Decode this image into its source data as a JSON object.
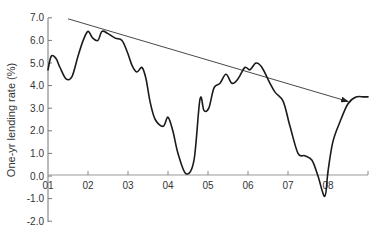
{
  "chart_data": {
    "type": "line",
    "title": "",
    "xlabel": "",
    "ylabel": "One-yr lending rate (%)",
    "ylim": [
      -2.0,
      7.0
    ],
    "xlim": [
      2001,
      2009
    ],
    "yticks": [
      "7.0",
      "6.0",
      "5.0",
      "4.0",
      "3.0",
      "2.0",
      "1.0",
      "0.0",
      "-1.0",
      "-2.0"
    ],
    "xticks": [
      "01",
      "02",
      "03",
      "04",
      "05",
      "06",
      "07",
      "08"
    ],
    "grid": false,
    "legend": null,
    "series": [
      {
        "name": "One-yr lending rate",
        "x": [
          2001.0,
          2001.08,
          2001.2,
          2001.3,
          2001.45,
          2001.6,
          2001.75,
          2001.88,
          2002.0,
          2002.12,
          2002.25,
          2002.35,
          2002.5,
          2002.68,
          2002.85,
          2002.98,
          2003.1,
          2003.22,
          2003.35,
          2003.45,
          2003.55,
          2003.68,
          2003.88,
          2004.0,
          2004.12,
          2004.25,
          2004.45,
          2004.65,
          2004.8,
          2004.9,
          2005.02,
          2005.15,
          2005.3,
          2005.45,
          2005.6,
          2005.75,
          2005.92,
          2006.05,
          2006.2,
          2006.35,
          2006.55,
          2006.68,
          2006.88,
          2007.05,
          2007.25,
          2007.42,
          2007.6,
          2007.75,
          2007.92,
          2008.0,
          2008.12,
          2008.3,
          2008.5,
          2008.7,
          2008.9,
          2009.0
        ],
        "values": [
          4.7,
          5.3,
          5.2,
          4.8,
          4.3,
          4.4,
          5.3,
          6.0,
          6.4,
          6.1,
          6.0,
          6.4,
          6.3,
          6.1,
          6.0,
          5.5,
          4.9,
          4.6,
          4.8,
          4.3,
          3.3,
          2.5,
          2.2,
          2.6,
          2.0,
          1.0,
          0.1,
          0.7,
          3.4,
          2.9,
          3.0,
          3.9,
          4.1,
          4.5,
          4.1,
          4.3,
          4.8,
          4.7,
          5.0,
          4.8,
          4.1,
          3.7,
          3.3,
          2.2,
          1.0,
          0.9,
          0.7,
          0.0,
          -0.9,
          0.2,
          1.5,
          2.4,
          3.2,
          3.5,
          3.5,
          3.5
        ]
      }
    ],
    "annotations": [
      {
        "type": "arrow",
        "description": "Downward trend arrow from early 2001 peak level to late 2008",
        "from": {
          "x": 2001.5,
          "y": 7.0
        },
        "to": {
          "x": 2008.5,
          "y": 3.3
        }
      }
    ]
  },
  "axes": {
    "ylabel": "One-yr lending rate (%)",
    "yticks": [
      "7.0",
      "6.0",
      "5.0",
      "4.0",
      "3.0",
      "2.0",
      "1.0",
      "0.0",
      "-1.0",
      "-2.0"
    ],
    "xticks": [
      "01",
      "02",
      "03",
      "04",
      "05",
      "06",
      "07",
      "08"
    ]
  }
}
